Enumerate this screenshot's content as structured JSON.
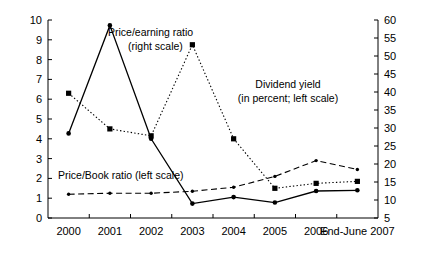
{
  "chart_data": {
    "type": "line",
    "title": "",
    "xlabel": "",
    "categories": [
      "2000",
      "2001",
      "2002",
      "2003",
      "2004",
      "2005",
      "2006",
      "End-June 2007"
    ],
    "left_axis": {
      "label": "",
      "ylim": [
        0,
        10
      ],
      "ticks": [
        "0",
        "1",
        "2",
        "3",
        "4",
        "5",
        "6",
        "7",
        "8",
        "9",
        "10"
      ]
    },
    "right_axis": {
      "label": "",
      "ylim": [
        5,
        60
      ],
      "ticks": [
        "5",
        "10",
        "15",
        "20",
        "25",
        "30",
        "35",
        "40",
        "45",
        "50",
        "55",
        "60"
      ]
    },
    "grid": false,
    "legend_position": "inline-annotations",
    "series": [
      {
        "name": "Price/earning ratio (right scale)",
        "axis": "right",
        "style": "solid",
        "marker": "circle",
        "values": [
          28.5,
          58.5,
          27.0,
          9.0,
          10.8,
          9.3,
          12.5,
          12.7
        ]
      },
      {
        "name": "Dividend yield (in percent; left scale)",
        "axis": "left",
        "style": "dotted",
        "marker": "square",
        "values": [
          6.3,
          4.5,
          4.15,
          8.75,
          4.0,
          1.5,
          1.75,
          1.85
        ]
      },
      {
        "name": "Price/Book ratio (left scale)",
        "axis": "left",
        "style": "dashed",
        "marker": "dot",
        "values": [
          1.2,
          1.25,
          1.25,
          1.35,
          1.55,
          2.1,
          2.9,
          2.45
        ]
      }
    ],
    "annotations": [
      {
        "id": "pe-annotation",
        "line1": "Price/earning ratio",
        "line2": "(right scale)"
      },
      {
        "id": "dy-annotation",
        "line1": "Dividend yield",
        "line2": "(in percent; left scale)"
      },
      {
        "id": "pb-annotation",
        "line1": "Price/Book ratio (left scale)",
        "line2": ""
      }
    ]
  }
}
